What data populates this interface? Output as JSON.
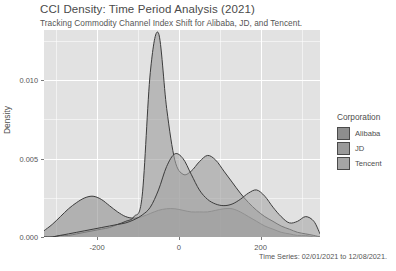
{
  "header": {
    "title": "CCI Density: Time Period Analysis (2021)",
    "subtitle": "Tracking Commodity Channel Index Shift for Alibaba, JD, and Tencent."
  },
  "legend": {
    "title": "Corporation",
    "items": [
      {
        "label": "Alibaba",
        "color": "#8e8e8e"
      },
      {
        "label": "JD",
        "color": "#9a9a9a"
      },
      {
        "label": "Tencent",
        "color": "#a6a6a6"
      }
    ]
  },
  "axis": {
    "y_label": "Density",
    "y_ticks": [
      "0.000",
      "0.005",
      "0.010"
    ],
    "x_ticks": [
      "-200",
      "0",
      "200"
    ],
    "caption": "Time Series: 02/01/2021 to 12/08/2021."
  },
  "chart_data": {
    "type": "area",
    "title": "CCI Density: Time Period Analysis (2021)",
    "subtitle": "Tracking Commodity Channel Index Shift for Alibaba, JD, and Tencent.",
    "xlabel": "Time Series: 02/01/2021 to 12/08/2021.",
    "ylabel": "Density",
    "xlim": [
      -330,
      345
    ],
    "ylim": [
      0,
      0.0132
    ],
    "xticks": [
      -200,
      0,
      200
    ],
    "yticks": [
      0.0,
      0.005,
      0.01
    ],
    "grid": true,
    "legend_position": "right",
    "legend_title": "Corporation",
    "x": [
      -330,
      -310,
      -290,
      -270,
      -250,
      -230,
      -210,
      -190,
      -170,
      -150,
      -130,
      -110,
      -90,
      -70,
      -50,
      -30,
      -10,
      10,
      30,
      50,
      70,
      90,
      110,
      130,
      150,
      170,
      190,
      210,
      230,
      250,
      270,
      290,
      310,
      330,
      345
    ],
    "series": [
      {
        "name": "Alibaba",
        "color": "#8e8e8e",
        "values": [
          0.0004,
          0.0008,
          0.0013,
          0.0018,
          0.0022,
          0.0025,
          0.0026,
          0.0024,
          0.002,
          0.0016,
          0.0013,
          0.0012,
          0.0013,
          0.0015,
          0.0017,
          0.0018,
          0.0018,
          0.0017,
          0.0016,
          0.0016,
          0.0016,
          0.0017,
          0.0018,
          0.0018,
          0.0016,
          0.0013,
          0.001,
          0.0007,
          0.0005,
          0.0003,
          0.0002,
          0.0001,
          0.0001,
          0.0,
          0.0
        ]
      },
      {
        "name": "JD",
        "color": "#9a9a9a",
        "values": [
          0.0,
          0.0,
          0.0001,
          0.0001,
          0.0002,
          0.0003,
          0.0004,
          0.0005,
          0.0006,
          0.0008,
          0.001,
          0.0013,
          0.0026,
          0.0105,
          0.013,
          0.0082,
          0.0049,
          0.004,
          0.0042,
          0.0048,
          0.0052,
          0.0049,
          0.0042,
          0.0035,
          0.0028,
          0.0022,
          0.0017,
          0.0013,
          0.001,
          0.0007,
          0.0005,
          0.0003,
          0.0002,
          0.0001,
          0.0
        ]
      },
      {
        "name": "Tencent",
        "color": "#a6a6a6",
        "values": [
          0.0,
          0.0,
          0.0001,
          0.0002,
          0.0003,
          0.0004,
          0.0005,
          0.0006,
          0.0007,
          0.0008,
          0.0009,
          0.0011,
          0.0014,
          0.0019,
          0.003,
          0.0045,
          0.0053,
          0.005,
          0.004,
          0.003,
          0.0024,
          0.0021,
          0.002,
          0.0021,
          0.0024,
          0.0028,
          0.003,
          0.0026,
          0.0019,
          0.0013,
          0.0009,
          0.001,
          0.0013,
          0.001,
          0.0002
        ]
      }
    ]
  }
}
